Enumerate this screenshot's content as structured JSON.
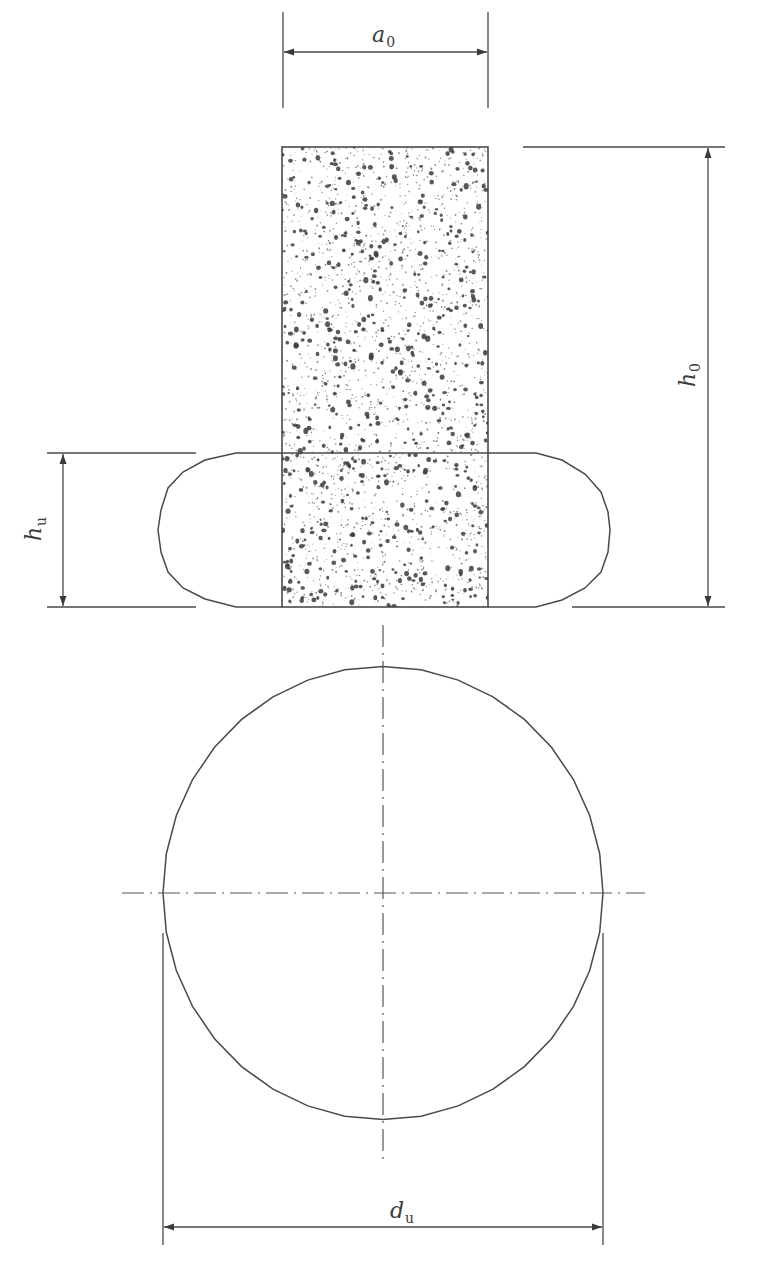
{
  "figure": {
    "type": "technical-drawing",
    "colors": {
      "line": "#4a4a4a",
      "fill_speckle": "#3c3c3c",
      "background": "#ffffff"
    }
  },
  "labels": {
    "a0": {
      "base": "a",
      "sub": "0"
    },
    "h0": {
      "base": "h",
      "sub": "0"
    },
    "hu": {
      "base": "h",
      "sub": "u"
    },
    "du": {
      "base": "d",
      "sub": "u"
    }
  },
  "views": {
    "front_view": {
      "specimen_rect": {
        "x": 282,
        "y": 147,
        "w": 206,
        "h": 460,
        "hatch": "speckle-concrete"
      },
      "deformed_outline": {
        "top_y": 453,
        "bottom_y": 607,
        "left_x": 158,
        "right_x": 610
      }
    },
    "top_view": {
      "circle": {
        "cx": 383,
        "cy": 893,
        "r": 220,
        "polygonal": true
      },
      "centerlines": [
        "vertical",
        "horizontal"
      ]
    }
  },
  "dimensions": [
    {
      "id": "a0",
      "orientation": "horizontal",
      "from": 283,
      "to": 488,
      "at": 52
    },
    {
      "id": "h0",
      "orientation": "vertical",
      "from": 147,
      "to": 607,
      "at": 708
    },
    {
      "id": "hu",
      "orientation": "vertical",
      "from": 453,
      "to": 607,
      "at": 63
    },
    {
      "id": "du",
      "orientation": "horizontal",
      "from": 163,
      "to": 603,
      "at": 1227
    }
  ]
}
